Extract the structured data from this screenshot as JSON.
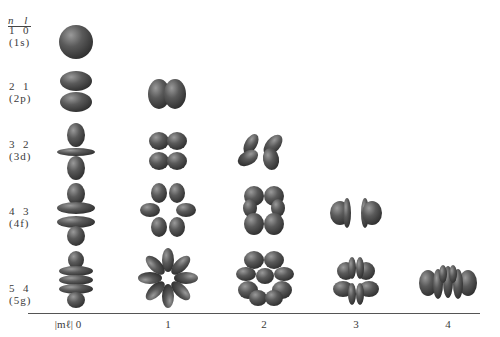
{
  "header": {
    "label": "n l"
  },
  "rows": [
    {
      "nl": "1  0",
      "name": "(1s)",
      "n": 1,
      "l": 0
    },
    {
      "nl": "2  1",
      "name": "(2p)",
      "n": 2,
      "l": 1
    },
    {
      "nl": "3  2",
      "name": "(3d)",
      "n": 3,
      "l": 2
    },
    {
      "nl": "4  3",
      "name": "(4f)",
      "n": 4,
      "l": 3
    },
    {
      "nl": "5  4",
      "name": "(5g)",
      "n": 5,
      "l": 4
    }
  ],
  "axis": {
    "label": "|mℓ| 0",
    "ticks": [
      "1",
      "2",
      "3",
      "4"
    ]
  },
  "colors": {
    "orbital": "#4a4a4a",
    "highlight": "#8a8a8a",
    "axis": "#555555"
  }
}
